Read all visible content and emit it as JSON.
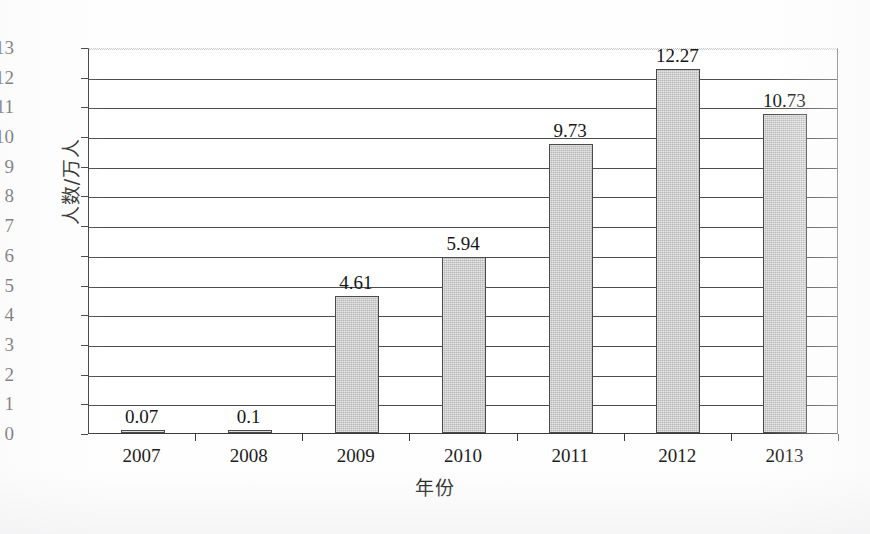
{
  "chart_data": {
    "type": "bar",
    "title": "",
    "subtitle": "",
    "categories": [
      "2007",
      "2008",
      "2009",
      "2010",
      "2011",
      "2012",
      "2013"
    ],
    "values": [
      0.07,
      0.1,
      4.61,
      5.94,
      9.73,
      12.27,
      10.73
    ],
    "data_labels": [
      "0.07",
      "0.1",
      "4.61",
      "5.94",
      "9.73",
      "12.27",
      "10.73"
    ],
    "xlabel": "年份",
    "ylabel": "人数/万人",
    "ylim": [
      0,
      13
    ],
    "ytick_step": 1,
    "ytick_labels": [
      "0",
      "1",
      "2",
      "3",
      "4",
      "5",
      "6",
      "7",
      "8",
      "9",
      "10",
      "11",
      "12",
      "13"
    ],
    "grid": "horizontal",
    "legend": "none",
    "series": [
      {
        "name": "人数",
        "values": [
          0.07,
          0.1,
          4.61,
          5.94,
          9.73,
          12.27,
          10.73
        ]
      }
    ],
    "colors": {
      "bar_fill": "#b7b7b7",
      "bar_border": "#4a4a4a",
      "gridline": "#4d4d4d",
      "axis": "#3a3a3a",
      "text": "#161616",
      "background": "#ffffff"
    }
  }
}
